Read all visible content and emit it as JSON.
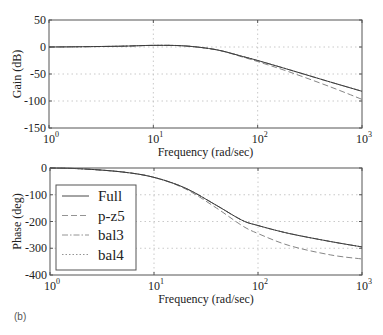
{
  "caption": "(b)",
  "chart_data": [
    {
      "type": "line",
      "title": "",
      "xlabel": "Frequency (rad/sec)",
      "ylabel": "Gain (dB)",
      "xscale": "log",
      "xlim": [
        1,
        1000
      ],
      "ylim": [
        -150,
        50
      ],
      "xticks": [
        "10^0",
        "10^1",
        "10^2",
        "10^3"
      ],
      "yticks": [
        "50",
        "0",
        "-50",
        "-100",
        "-150"
      ],
      "grid": true,
      "x": [
        1,
        2,
        5,
        10,
        20,
        40,
        70,
        100,
        200,
        500,
        1000
      ],
      "series": [
        {
          "name": "Full",
          "style": "solid",
          "values": [
            0,
            0.5,
            1.5,
            3,
            2,
            -5,
            -17,
            -25,
            -42,
            -65,
            -82
          ]
        },
        {
          "name": "p-z5",
          "style": "dashed",
          "values": [
            0,
            0.5,
            1.5,
            3,
            2,
            -5,
            -18,
            -27,
            -46,
            -74,
            -97
          ]
        },
        {
          "name": "bal3",
          "style": "dashdot",
          "values": [
            0,
            0.5,
            1.5,
            3,
            2,
            -5,
            -17,
            -25,
            -42,
            -65,
            -82
          ]
        },
        {
          "name": "bal4",
          "style": "dotted",
          "values": [
            0,
            0.5,
            1.5,
            3,
            2,
            -5,
            -17,
            -25,
            -42,
            -65,
            -82
          ]
        }
      ]
    },
    {
      "type": "line",
      "title": "",
      "xlabel": "Frequency (rad/sec)",
      "ylabel": "Phase (deg)",
      "xscale": "log",
      "xlim": [
        1,
        1000
      ],
      "ylim": [
        -400,
        0
      ],
      "xticks": [
        "10^0",
        "10^1",
        "10^2",
        "10^3"
      ],
      "yticks": [
        "0",
        "-100",
        "-200",
        "-300",
        "-400"
      ],
      "grid": true,
      "legend": {
        "position": "lower-left",
        "entries": [
          "Full",
          "p-z5",
          "bal3",
          "bal4"
        ]
      },
      "x": [
        1,
        2,
        5,
        10,
        20,
        40,
        70,
        100,
        200,
        500,
        1000
      ],
      "series": [
        {
          "name": "Full",
          "style": "solid",
          "values": [
            0,
            -3,
            -15,
            -35,
            -75,
            -140,
            -195,
            -215,
            -245,
            -275,
            -295
          ]
        },
        {
          "name": "p-z5",
          "style": "dashed",
          "values": [
            0,
            -3,
            -15,
            -35,
            -78,
            -150,
            -215,
            -245,
            -290,
            -325,
            -340
          ]
        },
        {
          "name": "bal3",
          "style": "dashdot",
          "values": [
            0,
            -3,
            -15,
            -35,
            -75,
            -140,
            -195,
            -215,
            -245,
            -275,
            -295
          ]
        },
        {
          "name": "bal4",
          "style": "dotted",
          "values": [
            0,
            -3,
            -15,
            -35,
            -75,
            -140,
            -195,
            -215,
            -245,
            -275,
            -295
          ]
        }
      ]
    }
  ]
}
